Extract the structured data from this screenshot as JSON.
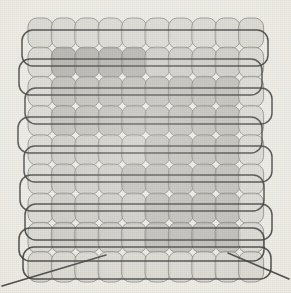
{
  "scene": {
    "title": "Abstract grid of rounded cells with horizontal band outlines",
    "width": 291,
    "height": 293,
    "background_color": "#eeece4",
    "stroke_color": "#6f6f6f",
    "band_stroke_color": "#3a3a3a",
    "line_color": "#3f3f3f"
  },
  "palette": {
    "cell_light": "#d6d4cd",
    "cell_mid": "#c9c7c0",
    "cell_dark": "#b4b2ac",
    "cell_darker": "#a9a7a1",
    "cell_edge": "#7d7d79"
  },
  "grid": {
    "label": "cell-grid",
    "columns": 10,
    "rows": 9,
    "origin_x": 28,
    "origin_y": 18,
    "cell_width": 23.4,
    "cell_height": 29.2,
    "cell_radius": 9,
    "shade_legend": [
      {
        "key": 0,
        "name": "light",
        "color": "#d8d6cf"
      },
      {
        "key": 1,
        "name": "mid",
        "color": "#c8c6bf"
      },
      {
        "key": 2,
        "name": "dark",
        "color": "#b6b4ae"
      },
      {
        "key": 3,
        "name": "darkest",
        "color": "#a8a6a0"
      }
    ],
    "shading_matrix": [
      [
        0,
        0,
        0,
        0,
        0,
        0,
        0,
        0,
        0,
        0
      ],
      [
        0,
        3,
        3,
        3,
        3,
        1,
        1,
        1,
        1,
        0
      ],
      [
        0,
        2,
        2,
        2,
        2,
        2,
        2,
        2,
        2,
        0
      ],
      [
        0,
        2,
        2,
        2,
        2,
        2,
        2,
        2,
        2,
        0
      ],
      [
        0,
        1,
        1,
        1,
        1,
        2,
        2,
        2,
        2,
        0
      ],
      [
        0,
        1,
        1,
        1,
        2,
        2,
        2,
        2,
        2,
        0
      ],
      [
        0,
        1,
        1,
        1,
        1,
        2,
        2,
        2,
        2,
        0
      ],
      [
        0,
        1,
        1,
        1,
        1,
        2,
        2,
        2,
        2,
        0
      ],
      [
        0,
        0,
        0,
        0,
        0,
        0,
        0,
        0,
        0,
        0
      ]
    ]
  },
  "bands": {
    "label": "horizontal-band-outlines",
    "count": 9,
    "radius": 11,
    "items": [
      {
        "x": 22,
        "y": 30,
        "w": 246,
        "h": 36
      },
      {
        "x": 19,
        "y": 59,
        "w": 243,
        "h": 36
      },
      {
        "x": 25,
        "y": 88,
        "w": 247,
        "h": 36
      },
      {
        "x": 18,
        "y": 117,
        "w": 244,
        "h": 36
      },
      {
        "x": 24,
        "y": 146,
        "w": 248,
        "h": 36
      },
      {
        "x": 20,
        "y": 175,
        "w": 244,
        "h": 36
      },
      {
        "x": 25,
        "y": 204,
        "w": 247,
        "h": 36
      },
      {
        "x": 19,
        "y": 228,
        "w": 245,
        "h": 33
      },
      {
        "x": 23,
        "y": 247,
        "w": 248,
        "h": 32
      }
    ]
  },
  "diagonals": {
    "label": "corner-diagonal-lines",
    "items": [
      {
        "name": "diagonal-left",
        "x1": 2,
        "y1": 286,
        "x2": 106,
        "y2": 255
      },
      {
        "name": "diagonal-right",
        "x1": 228,
        "y1": 253,
        "x2": 289,
        "y2": 279
      }
    ]
  }
}
